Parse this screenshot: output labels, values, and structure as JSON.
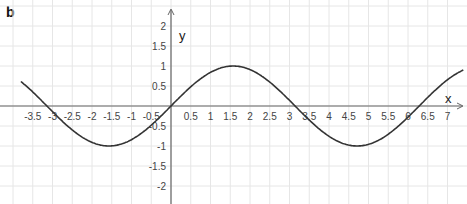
{
  "panel_label": "b",
  "chart_data": {
    "type": "line",
    "title": "",
    "function": "y = sin(x)",
    "xlabel": "x",
    "ylabel": "y",
    "xlim": [
      -3.8,
      7.4
    ],
    "ylim": [
      -2.4,
      2.6
    ],
    "grid": true,
    "x_ticks": [
      "-3.5",
      "-3",
      "-2.5",
      "-2",
      "-1.5",
      "-1",
      "-0.5",
      "0.5",
      "1",
      "1.5",
      "2",
      "2.5",
      "3",
      "3.5",
      "4",
      "4.5",
      "5",
      "5.5",
      "6",
      "6.5",
      "7"
    ],
    "x_tick_values": [
      -3.5,
      -3,
      -2.5,
      -2,
      -1.5,
      -1,
      -0.5,
      0.5,
      1,
      1.5,
      2,
      2.5,
      3,
      3.5,
      4,
      4.5,
      5,
      5.5,
      6,
      6.5,
      7
    ],
    "y_ticks": [
      "2",
      "1.5",
      "1",
      "0.5",
      "-0.5",
      "-1",
      "-1.5",
      "-2"
    ],
    "y_tick_values": [
      2,
      1.5,
      1,
      0.5,
      -0.5,
      -1,
      -1.5,
      -2
    ],
    "series": [
      {
        "name": "sin(x)",
        "x": [
          -3.8,
          -3.14,
          -2.36,
          -1.57,
          -0.79,
          0,
          0.79,
          1.57,
          2.36,
          3.14,
          3.93,
          4.71,
          5.5,
          6.28,
          7.0,
          7.4
        ],
        "values": [
          0.61,
          0,
          -0.71,
          -1,
          -0.71,
          0,
          0.71,
          1,
          0.71,
          0,
          -0.71,
          -1,
          -0.71,
          0,
          0.66,
          0.9
        ]
      }
    ],
    "colors": {
      "curve": "#333333",
      "axis": "#666666",
      "grid": "#e6e6e6"
    }
  }
}
